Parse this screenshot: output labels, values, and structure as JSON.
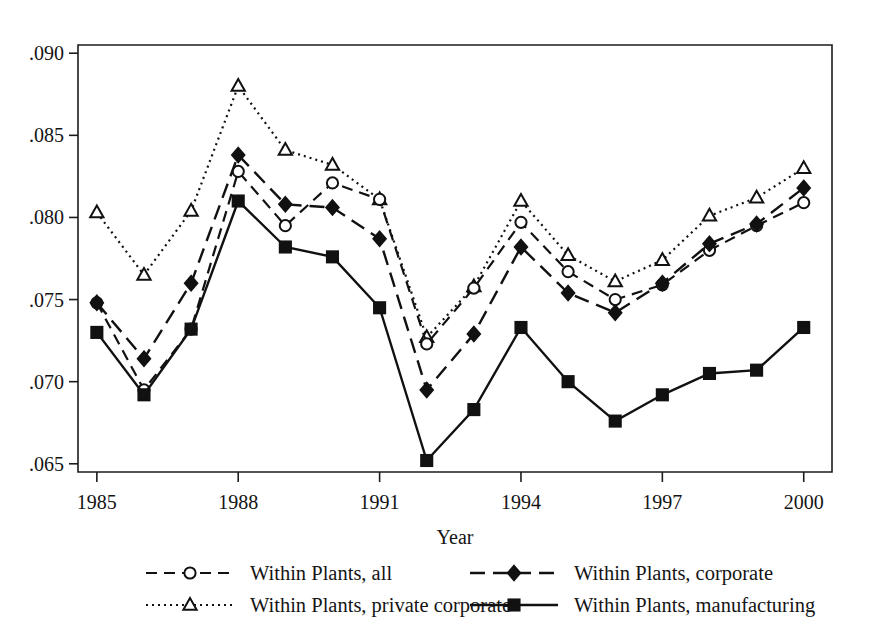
{
  "chart_data": {
    "type": "line",
    "title": "",
    "xlabel": "Year",
    "ylabel": "",
    "x": [
      1985,
      1986,
      1987,
      1988,
      1989,
      1990,
      1991,
      1992,
      1993,
      1994,
      1995,
      1996,
      1997,
      1998,
      1999,
      2000
    ],
    "xlim": [
      1984.6,
      2000.6
    ],
    "ylim": [
      0.0645,
      0.0905
    ],
    "xticks": [
      1985,
      1988,
      1991,
      1994,
      1997,
      2000
    ],
    "xticklabels": [
      "1985",
      "1988",
      "1991",
      "1994",
      "1997",
      "2000"
    ],
    "yticks": [
      0.065,
      0.07,
      0.075,
      0.08,
      0.085,
      0.09
    ],
    "yticklabels": [
      ".065",
      ".070",
      ".075",
      ".080",
      ".085",
      ".090"
    ],
    "grid": false,
    "legend_position": "below-axes",
    "series": [
      {
        "name": "Within Plants, all",
        "marker": "open-circle",
        "linestyle": "dashed",
        "values": [
          0.0748,
          0.0695,
          0.0732,
          0.0828,
          0.0795,
          0.0821,
          0.0811,
          0.0723,
          0.0757,
          0.0797,
          0.0767,
          0.075,
          0.0759,
          0.078,
          0.0795,
          0.0809
        ]
      },
      {
        "name": "Within Plants, private corporate",
        "marker": "open-triangle",
        "linestyle": "dotted",
        "values": [
          0.0803,
          0.0765,
          0.0804,
          0.088,
          0.0841,
          0.0832,
          0.0811,
          0.0727,
          0.0758,
          0.081,
          0.0777,
          0.0761,
          0.0774,
          0.0801,
          0.0812,
          0.083
        ]
      },
      {
        "name": "Within Plants, corporate",
        "marker": "filled-diamond",
        "linestyle": "long-dashed",
        "values": [
          0.0748,
          0.0714,
          0.076,
          0.0838,
          0.0808,
          0.0806,
          0.0787,
          0.0695,
          0.0729,
          0.0782,
          0.0754,
          0.0742,
          0.076,
          0.0784,
          0.0796,
          0.0818
        ]
      },
      {
        "name": "Within Plants, manufacturing",
        "marker": "filled-square",
        "linestyle": "solid",
        "values": [
          0.073,
          0.0692,
          0.0732,
          0.081,
          0.0782,
          0.0776,
          0.0745,
          0.0652,
          0.0683,
          0.0733,
          0.07,
          0.0676,
          0.0692,
          0.0705,
          0.0707,
          0.0733
        ]
      }
    ]
  },
  "legend": {
    "items": [
      {
        "label": "Within Plants, all"
      },
      {
        "label": "Within Plants, corporate"
      },
      {
        "label": "Within Plants, private corporate"
      },
      {
        "label": "Within Plants, manufacturing"
      }
    ]
  },
  "colors": {
    "ink": "#111111",
    "background": "#ffffff"
  }
}
